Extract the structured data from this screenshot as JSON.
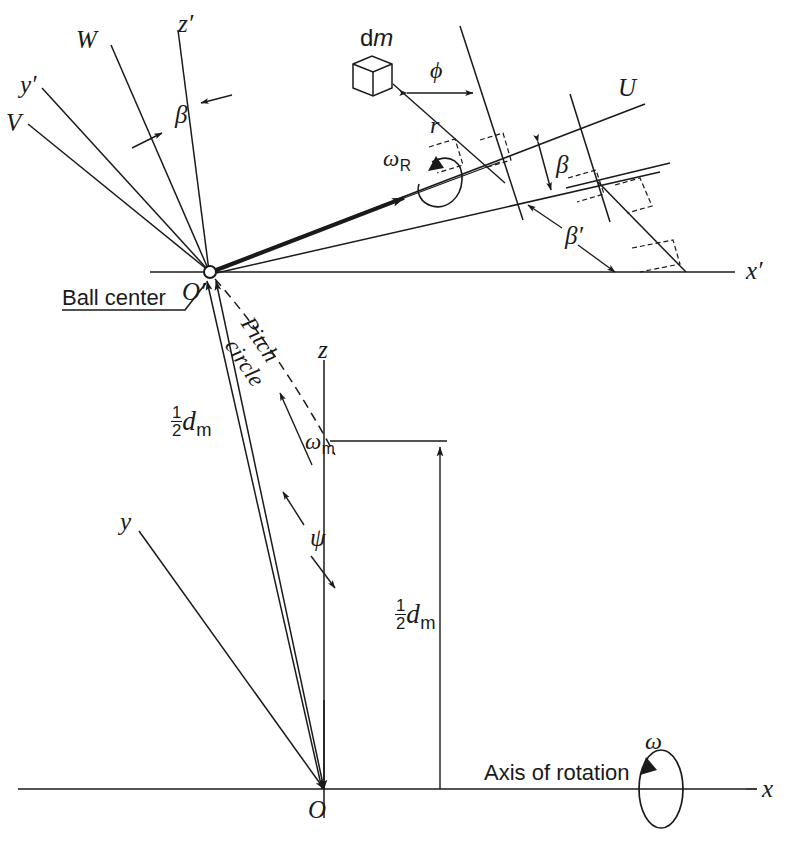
{
  "figure": {
    "type": "engineering-kinematics-diagram",
    "background_color": "#ffffff",
    "line_color": "#1a1a1a"
  },
  "axes": {
    "x_prime": "x′",
    "y_prime": "y′",
    "z_prime": "z′",
    "x": "x",
    "y": "y",
    "z": "z",
    "U": "U",
    "V": "V",
    "W": "W"
  },
  "angles": {
    "beta_upper_left": "β",
    "beta_right": "β",
    "beta_prime": "β′",
    "phi": "ϕ",
    "psi": "ψ"
  },
  "rotations": {
    "omega": "ω",
    "omega_R_base": "ω",
    "omega_R_sub": "R",
    "omega_m_base": "ω",
    "omega_m_sub": "m"
  },
  "labels": {
    "ball_center": "Ball center",
    "pitch": "Pitch",
    "circle": "circle",
    "axis_of_rotation": "Axis of rotation",
    "origin_prime": "O′",
    "origin": "O",
    "radius_r": "r",
    "dm_d": "d",
    "dm_m": "m"
  },
  "dimensions": {
    "half_dm_left": {
      "num": "1",
      "den": "2",
      "symbol": "d",
      "sub": "m"
    },
    "half_dm_right": {
      "num": "1",
      "den": "2",
      "symbol": "d",
      "sub": "m"
    }
  }
}
